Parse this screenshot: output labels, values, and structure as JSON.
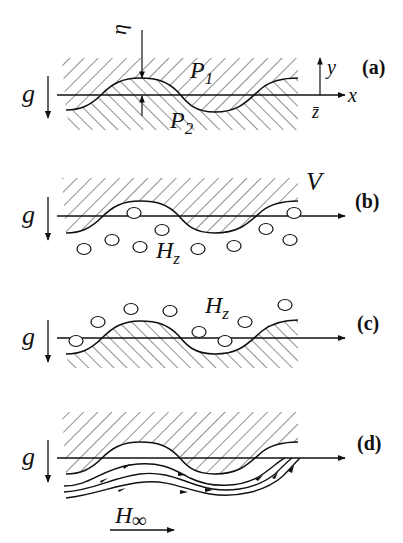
{
  "figure": {
    "panels": [
      {
        "id": "a",
        "tag": "(a)",
        "gravity": "g",
        "labels": {
          "eta": "η",
          "upper": "P",
          "upper_sub": "1",
          "lower": "P",
          "lower_sub": "2",
          "y_axis": "y",
          "x_axis": "x",
          "z_axis": "z̄"
        },
        "description": "Interface between two fluids P1 (above) and P2 (below), wave amplitude η"
      },
      {
        "id": "b",
        "tag": "(b)",
        "gravity": "g",
        "labels": {
          "upper": "V",
          "field": "H",
          "field_sub": "z"
        },
        "description": "Upper medium V, bubbles below interface with field Hz"
      },
      {
        "id": "c",
        "tag": "(c)",
        "gravity": "g",
        "labels": {
          "field": "H",
          "field_sub": "z"
        },
        "description": "Lower medium hatched, bubbles above interface with field Hz"
      },
      {
        "id": "d",
        "tag": "(d)",
        "gravity": "g",
        "labels": {
          "field": "H",
          "field_sub": "∞"
        },
        "description": "Upper medium hatched, field lines H∞ flowing under the interface"
      }
    ]
  }
}
